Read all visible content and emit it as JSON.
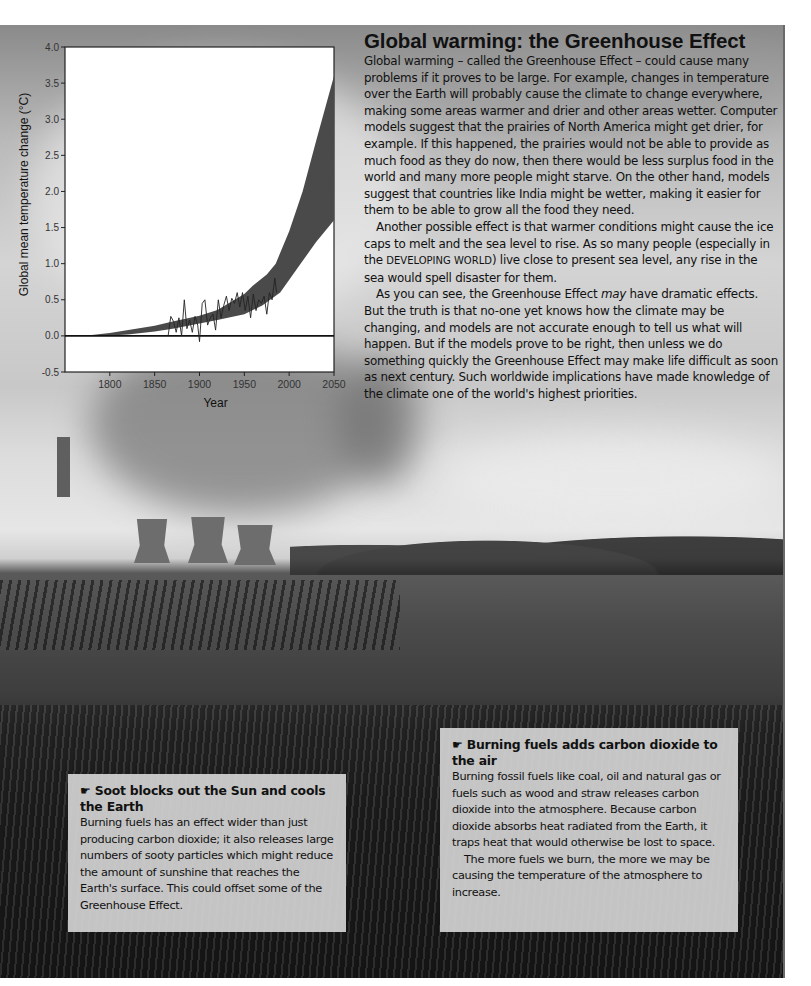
{
  "article": {
    "title": "Global warming: the Greenhouse Effect",
    "paragraphs": [
      "Global warming – called the Greenhouse Effect – could cause many problems if it proves to be large. For example, changes in temperature over the Earth will probably cause the climate to change everywhere, making some areas warmer and drier and other areas wetter. Computer models suggest that the prairies of North America might get drier, for example. If this happened, the prairies would not be able to provide as much food as they do now, then there would be less surplus food in the world and many more people might starve. On the other hand, models suggest that countries like India might be wetter, making it easier for them to be able to grow all the food they need."
    ],
    "p2_before": "Another possible effect is that warmer conditions might cause the ice caps to melt and the sea level to rise. As so many people (especially in the ",
    "p2_term": "DEVELOPING WORLD",
    "p2_after": ") live close to present sea level, any rise in the sea would spell disaster for them.",
    "p3_before": "As you can see, the Greenhouse Effect ",
    "p3_em": "may",
    "p3_after": " have dramatic effects. But the truth is that no-one yet knows how the climate may be changing, and models are not accurate enough to tell us what will happen. But if the models prove to be right, then unless we do something quickly the Greenhouse Effect may make life difficult as soon as next century. Such worldwide implications have made knowledge of the climate one of the world's highest priorities."
  },
  "boxes": {
    "soot": {
      "icon": "☛",
      "title": "Soot blocks out the Sun and cools the Earth",
      "body": "Burning fuels has an effect wider than just producing carbon dioxide; it also releases large numbers of sooty particles which might reduce the amount of sunshine that reaches the Earth's surface. This could offset some of the Greenhouse Effect."
    },
    "co2": {
      "icon": "☛",
      "title": "Burning fuels adds carbon dioxide to the air",
      "body1": "Burning fossil fuels like coal, oil and natural gas or fuels such as wood and straw releases carbon dioxide into the atmosphere. Because carbon dioxide absorbs heat radiated from the Earth, it traps heat that would otherwise be lost to space.",
      "body2": "The more fuels we burn, the more we may be causing the temperature of the atmosphere to increase."
    }
  },
  "chart_data": {
    "type": "area",
    "title": "",
    "xlabel": "Year",
    "ylabel": "Global mean temperature change (°C)",
    "xlim": [
      1750,
      2050
    ],
    "ylim": [
      -0.5,
      4.0
    ],
    "x_ticks": [
      "1800",
      "1850",
      "1900",
      "1950",
      "2000",
      "2050"
    ],
    "y_ticks": [
      "-0.5",
      "0.0",
      "0.5",
      "1.0",
      "1.5",
      "2.0",
      "2.5",
      "3.0",
      "3.5",
      "4.0"
    ],
    "grid": false,
    "legend": null,
    "reference_line": {
      "y": 0.0
    },
    "series": [
      {
        "name": "Projected range (upper bound)",
        "x": [
          1770,
          1800,
          1850,
          1870,
          1900,
          1920,
          1950,
          1960,
          1975,
          1985,
          2000,
          2015,
          2030,
          2050
        ],
        "values": [
          0.0,
          0.04,
          0.14,
          0.2,
          0.28,
          0.36,
          0.58,
          0.7,
          0.85,
          1.0,
          1.45,
          2.0,
          2.7,
          3.6
        ]
      },
      {
        "name": "Projected range (lower bound)",
        "x": [
          1790,
          1820,
          1850,
          1870,
          1900,
          1920,
          1950,
          1970,
          1990,
          2010,
          2030,
          2050
        ],
        "values": [
          0.0,
          0.02,
          0.06,
          0.1,
          0.17,
          0.22,
          0.3,
          0.42,
          0.6,
          0.95,
          1.3,
          1.6
        ]
      },
      {
        "name": "Observed temperature",
        "x": [
          1865,
          1868,
          1871,
          1874,
          1877,
          1880,
          1883,
          1886,
          1889,
          1892,
          1895,
          1898,
          1900,
          1903,
          1906,
          1909,
          1912,
          1915,
          1918,
          1921,
          1924,
          1927,
          1930,
          1933,
          1936,
          1939,
          1942,
          1945,
          1948,
          1951,
          1954,
          1957,
          1960,
          1963,
          1966,
          1969,
          1972,
          1975,
          1978,
          1981,
          1984,
          1986
        ],
        "values": [
          0.0,
          0.27,
          0.2,
          0.05,
          0.25,
          0.0,
          0.5,
          0.1,
          0.22,
          0.05,
          0.27,
          0.15,
          -0.08,
          0.45,
          0.5,
          0.15,
          0.25,
          0.3,
          0.08,
          0.5,
          0.25,
          0.42,
          0.55,
          0.35,
          0.52,
          0.45,
          0.6,
          0.4,
          0.6,
          0.35,
          0.55,
          0.25,
          0.58,
          0.35,
          0.5,
          0.45,
          0.55,
          0.3,
          0.6,
          0.5,
          0.8,
          0.6
        ]
      }
    ]
  }
}
